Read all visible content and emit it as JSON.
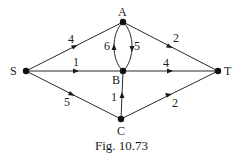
{
  "diagram": {
    "type": "directed-weighted-graph",
    "caption": "Fig. 10.73",
    "nodes": [
      {
        "id": "S",
        "label": "S",
        "x": 26,
        "y": 71
      },
      {
        "id": "A",
        "label": "A",
        "x": 123,
        "y": 22
      },
      {
        "id": "B",
        "label": "B",
        "x": 123,
        "y": 71
      },
      {
        "id": "C",
        "label": "C",
        "x": 121,
        "y": 119
      },
      {
        "id": "T",
        "label": "T",
        "x": 218,
        "y": 71
      }
    ],
    "edges": [
      {
        "from": "S",
        "to": "A",
        "weight": "4"
      },
      {
        "from": "S",
        "to": "B",
        "weight": "1"
      },
      {
        "from": "S",
        "to": "C",
        "weight": "5"
      },
      {
        "from": "B",
        "to": "A",
        "weight": "6"
      },
      {
        "from": "A",
        "to": "B",
        "weight": "5"
      },
      {
        "from": "A",
        "to": "T",
        "weight": "2"
      },
      {
        "from": "B",
        "to": "T",
        "weight": "4"
      },
      {
        "from": "C",
        "to": "B",
        "weight": "1"
      },
      {
        "from": "C",
        "to": "T",
        "weight": "2"
      }
    ]
  }
}
